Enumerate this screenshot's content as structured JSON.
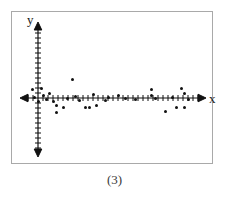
{
  "figure": {
    "caption": "(3)",
    "axis_labels": {
      "x": "x",
      "y": "y"
    },
    "frame_color": "#a9a9a9",
    "axis_color": "#111111",
    "point_color": "#111111",
    "background_color": "#ffffff"
  },
  "chart_data": {
    "type": "scatter",
    "title": "",
    "subtitle": "",
    "xlabel": "x",
    "ylabel": "y",
    "caption": "(3)",
    "grid": false,
    "legend": null,
    "axis_style": "double-arrow cartesian axes with unit tick marks",
    "origin_px": [
      38,
      98
    ],
    "x_axis_range_px": [
      22,
      205
    ],
    "y_axis_range_px": [
      22,
      157
    ],
    "tick_spacing_px": 5,
    "correlation": "no correlation",
    "points_px": [
      [
        32,
        89
      ],
      [
        34,
        97
      ],
      [
        38,
        101
      ],
      [
        41,
        88
      ],
      [
        43,
        95
      ],
      [
        46,
        99
      ],
      [
        49,
        93
      ],
      [
        53,
        101
      ],
      [
        56,
        105
      ],
      [
        56,
        112
      ],
      [
        63,
        107
      ],
      [
        67,
        98
      ],
      [
        72,
        79
      ],
      [
        75,
        96
      ],
      [
        79,
        100
      ],
      [
        85,
        107
      ],
      [
        89,
        107
      ],
      [
        93,
        94
      ],
      [
        96,
        105
      ],
      [
        105,
        100
      ],
      [
        108,
        97
      ],
      [
        118,
        95
      ],
      [
        125,
        98
      ],
      [
        135,
        99
      ],
      [
        151,
        89
      ],
      [
        151,
        95
      ],
      [
        155,
        98
      ],
      [
        165,
        111
      ],
      [
        172,
        97
      ],
      [
        176,
        107
      ],
      [
        181,
        88
      ],
      [
        184,
        93
      ],
      [
        184,
        107
      ],
      [
        188,
        99
      ]
    ],
    "points_data": [
      {
        "x": -1.2,
        "y": 1.8
      },
      {
        "x": -0.8,
        "y": 0.2
      },
      {
        "x": 0.0,
        "y": -0.6
      },
      {
        "x": 0.6,
        "y": 2.0
      },
      {
        "x": 1.0,
        "y": 0.6
      },
      {
        "x": 1.6,
        "y": -0.2
      },
      {
        "x": 2.2,
        "y": 1.0
      },
      {
        "x": 3.0,
        "y": -0.6
      },
      {
        "x": 3.6,
        "y": -1.4
      },
      {
        "x": 3.6,
        "y": -2.8
      },
      {
        "x": 5.0,
        "y": -1.8
      },
      {
        "x": 5.8,
        "y": 0.0
      },
      {
        "x": 6.8,
        "y": 3.8
      },
      {
        "x": 7.4,
        "y": 0.4
      },
      {
        "x": 8.2,
        "y": -0.4
      },
      {
        "x": 9.4,
        "y": -1.8
      },
      {
        "x": 10.2,
        "y": -1.8
      },
      {
        "x": 11.0,
        "y": 0.8
      },
      {
        "x": 11.6,
        "y": -1.4
      },
      {
        "x": 13.4,
        "y": -0.4
      },
      {
        "x": 14.0,
        "y": 0.2
      },
      {
        "x": 16.0,
        "y": 0.6
      },
      {
        "x": 17.4,
        "y": 0.0
      },
      {
        "x": 19.4,
        "y": -0.2
      },
      {
        "x": 22.6,
        "y": 1.8
      },
      {
        "x": 22.6,
        "y": 0.6
      },
      {
        "x": 23.4,
        "y": 0.0
      },
      {
        "x": 25.4,
        "y": -2.6
      },
      {
        "x": 26.8,
        "y": 0.2
      },
      {
        "x": 27.6,
        "y": -1.8
      },
      {
        "x": 28.6,
        "y": 2.0
      },
      {
        "x": 29.2,
        "y": 1.0
      },
      {
        "x": 29.2,
        "y": -1.8
      },
      {
        "x": 30.0,
        "y": -0.2
      }
    ]
  }
}
